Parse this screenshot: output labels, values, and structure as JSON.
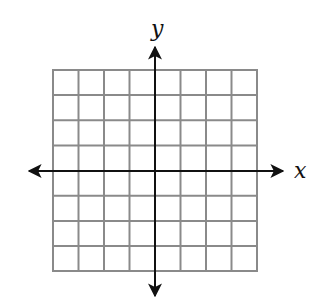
{
  "diagram": {
    "type": "coordinate-grid",
    "grid": {
      "columns": 8,
      "rows": 8,
      "line_color": "#8a8a8a",
      "border_color": "#8a8a8a"
    },
    "axes": {
      "x_label": "x",
      "y_label": "y",
      "color": "#111111",
      "x_axis_arrows": "both",
      "y_axis_arrows": "both"
    }
  }
}
